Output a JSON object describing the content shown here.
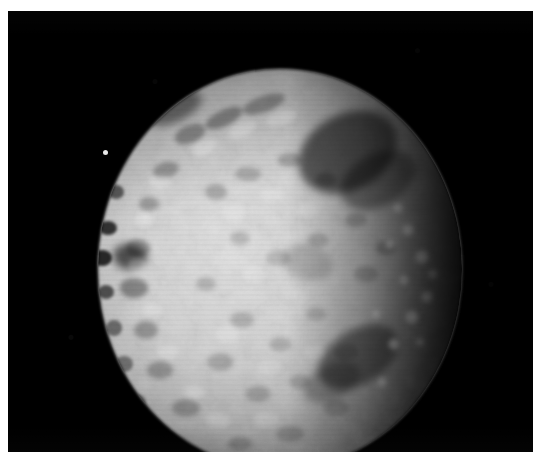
{
  "page": {
    "width": 545,
    "height": 467,
    "background_color": "#ffffff",
    "margin_color": "#ffffff"
  },
  "photograph": {
    "kind": "spacecraft-image",
    "subject": "heavily cratered icy moon",
    "alt_text": "Grayscale spacecraft photograph of a heavily cratered icy moon, lit from the left, with a dark terminator along the upper-right limb",
    "color_mode": "grayscale",
    "sky_color": "#000000",
    "plate": {
      "x": 8,
      "y": 11,
      "width": 525,
      "height": 441
    }
  },
  "moon": {
    "label": "moon-disk",
    "center_x": 272,
    "center_y": 258,
    "radius_x": 186,
    "radius_y": 206,
    "illumination": "left-lit crescent-to-gibbous, terminator on right",
    "surface_color_bright": "#d8d8d8",
    "surface_color_mid": "#9a9a9a",
    "surface_color_dark": "#2b2b2b",
    "limb_color": "#bfbfbf",
    "terminator_color": "#161616"
  },
  "features": {
    "bright_spot": {
      "name": "detached-bright-spot",
      "x": 104,
      "y": 152,
      "size": 5,
      "color": "#e9e9e9"
    },
    "dark_craters": [
      {
        "name": "upper-right-dark-basin",
        "cx": 340,
        "cy": 140,
        "rx": 52,
        "ry": 38,
        "rot": -28,
        "opacity": 0.55
      },
      {
        "name": "lower-right-dark-crater",
        "cx": 350,
        "cy": 345,
        "rx": 44,
        "ry": 27,
        "rot": -32,
        "opacity": 0.45
      },
      {
        "name": "left-limb-notch-crater",
        "cx": 122,
        "cy": 245,
        "rx": 17,
        "ry": 13,
        "rot": 10,
        "opacity": 0.62
      },
      {
        "name": "upper-left-rim-shadow",
        "cx": 166,
        "cy": 96,
        "rx": 30,
        "ry": 14,
        "rot": -24,
        "opacity": 0.45
      },
      {
        "name": "mid-dark-patch",
        "cx": 300,
        "cy": 250,
        "rx": 26,
        "ry": 18,
        "rot": 15,
        "opacity": 0.22
      }
    ],
    "bright_crater_rims": [
      {
        "cx": 400,
        "cy": 218,
        "r": 5
      },
      {
        "cx": 414,
        "cy": 245,
        "r": 6
      },
      {
        "cx": 396,
        "cy": 268,
        "r": 4
      },
      {
        "cx": 419,
        "cy": 285,
        "r": 5
      },
      {
        "cx": 404,
        "cy": 305,
        "r": 6
      },
      {
        "cx": 382,
        "cy": 232,
        "r": 4
      },
      {
        "cx": 390,
        "cy": 196,
        "r": 4
      },
      {
        "cx": 425,
        "cy": 262,
        "r": 4
      }
    ]
  }
}
